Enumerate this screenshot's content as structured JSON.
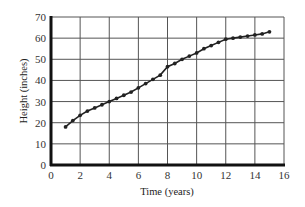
{
  "chart_data": {
    "type": "line",
    "title": "",
    "xlabel": "Time (years)",
    "ylabel": "Height (inches)",
    "xlim": [
      0,
      16
    ],
    "ylim": [
      0,
      70
    ],
    "xticks": [
      0,
      2,
      4,
      6,
      8,
      10,
      12,
      14,
      16
    ],
    "yticks": [
      0,
      10,
      20,
      30,
      40,
      50,
      60,
      70
    ],
    "grid": true,
    "legend": null,
    "series": [
      {
        "name": "Height",
        "marker": "circle",
        "color": "#222222",
        "x": [
          1,
          1.5,
          2,
          2.5,
          3,
          3.5,
          4,
          4.5,
          5,
          5.5,
          6,
          6.5,
          7,
          7.5,
          8,
          8.5,
          9,
          9.5,
          10,
          10.5,
          11,
          11.5,
          12,
          12.5,
          13,
          13.5,
          14,
          14.5,
          15
        ],
        "values": [
          18,
          21,
          23.5,
          25.5,
          27,
          28.5,
          30,
          31.5,
          33,
          34.5,
          36.5,
          38.5,
          40.5,
          42.5,
          46.5,
          48,
          50,
          51.5,
          53,
          55,
          56.5,
          58,
          59.5,
          60,
          60.5,
          61,
          61.5,
          62,
          63
        ]
      }
    ]
  }
}
